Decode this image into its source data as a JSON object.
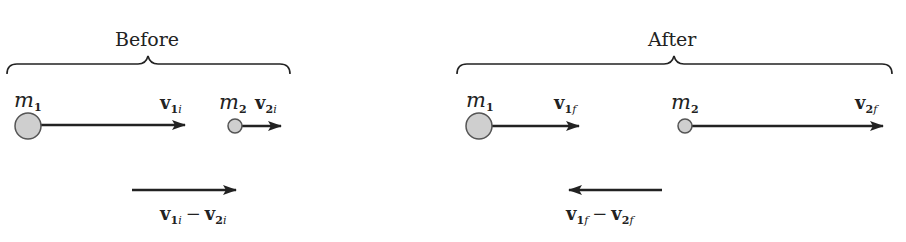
{
  "before": {
    "title": "Before",
    "m1": {
      "sym": "m",
      "sub": "1"
    },
    "m2": {
      "sym": "m",
      "sub": "2"
    },
    "v1": {
      "sym": "v",
      "num": "1",
      "idx": "i"
    },
    "v2": {
      "sym": "v",
      "num": "2",
      "idx": "i"
    },
    "rel": {
      "a_sym": "v",
      "a_num": "1",
      "a_idx": "i",
      "op": "−",
      "b_sym": "v",
      "b_num": "2",
      "b_idx": "i"
    }
  },
  "after": {
    "title": "After",
    "m1": {
      "sym": "m",
      "sub": "1"
    },
    "m2": {
      "sym": "m",
      "sub": "2"
    },
    "v1": {
      "sym": "v",
      "num": "1",
      "idx": "f"
    },
    "v2": {
      "sym": "v",
      "num": "2",
      "idx": "f"
    },
    "rel": {
      "a_sym": "v",
      "a_num": "1",
      "a_idx": "f",
      "op": "−",
      "b_sym": "v",
      "b_num": "2",
      "b_idx": "f"
    }
  },
  "colors": {
    "ink": "#222222",
    "ball_fill": "#cfcfcf",
    "ball_stroke": "#555555"
  }
}
